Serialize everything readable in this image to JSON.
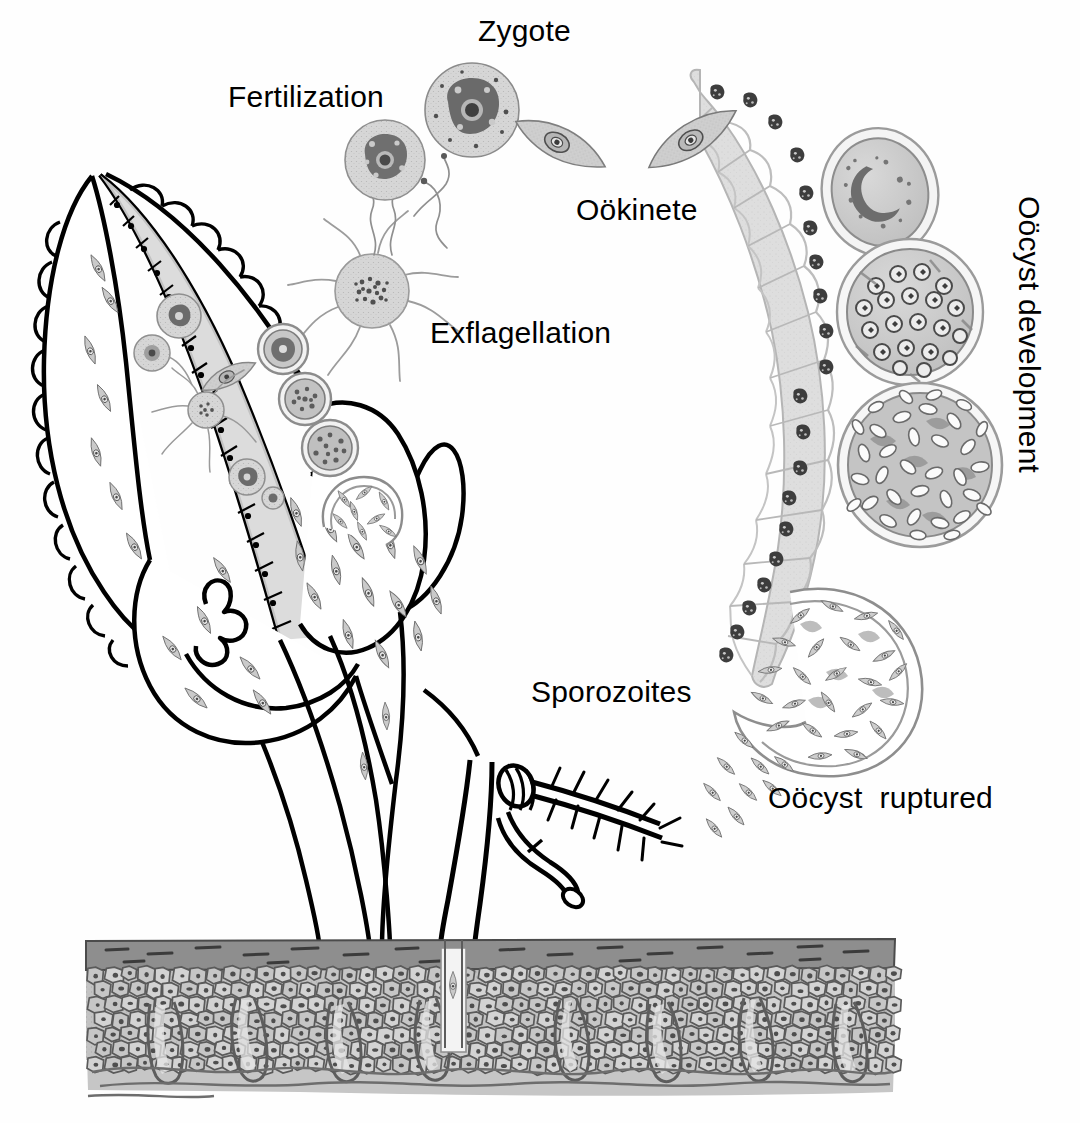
{
  "figure": {
    "type": "biological-diagram",
    "background_color": "#ffffff",
    "ink_color": "#000000",
    "tissue_fill": "#d8d8d8",
    "cell_fill": "#c9c9c9",
    "nucleus_color": "#4a4a4a",
    "skin_fill": "#b9b9b9",
    "skin_corneum": "#8f8f8f"
  },
  "labels": {
    "zygote": "Zygote",
    "fertilization": "Fertilization",
    "ookinete": "Oökinete",
    "exflagellation": "Exflagellation",
    "oocyst_development": "Oöcyst development",
    "oocyst_ruptured": "Oöcyst  ruptured",
    "sporozoites": "Sporozoites"
  },
  "label_positions": {
    "zygote": {
      "x": 478,
      "y": 16,
      "rotate": 0
    },
    "fertilization": {
      "x": 228,
      "y": 82,
      "rotate": 0
    },
    "ookinete": {
      "x": 576,
      "y": 195,
      "rotate": 0
    },
    "exflagellation": {
      "x": 430,
      "y": 318,
      "rotate": 0
    },
    "oocyst_development": {
      "x": 1044,
      "y": 196,
      "rotate": 90
    },
    "sporozoites": {
      "x": 531,
      "y": 677,
      "rotate": 0
    },
    "oocyst_ruptured": {
      "x": 768,
      "y": 783,
      "rotate": 0
    }
  },
  "stages": [
    {
      "name": "exflagellation",
      "description": "Microgametocyte exflagellating, producing whip-like microgametes (flagella)",
      "count_flagella": 7
    },
    {
      "name": "fertilization",
      "description": "Microgamete fertilizing the macrogamete",
      "cells": 1
    },
    {
      "name": "zygote",
      "description": "Fertilized zygote with prominent nucleus",
      "cells": 1
    },
    {
      "name": "ookinete",
      "description": "Motile banana-shaped ookinete penetrating the gut wall",
      "cells": 2
    },
    {
      "name": "oocyst-young",
      "description": "Young oocyst on the outer gut wall with crescent nucleus",
      "cells": 1
    },
    {
      "name": "oocyst-sporoblast",
      "description": "Oocyst with sporoblast masses / developing nuclei",
      "cells": 1
    },
    {
      "name": "oocyst-mature",
      "description": "Mature oocyst packed with sporozoites",
      "sporozoite_count": 34
    },
    {
      "name": "oocyst-ruptured",
      "description": "Ruptured oocyst releasing sporozoites into the haemocoel",
      "sporozoite_count": 38
    },
    {
      "name": "salivary-gland",
      "description": "Salivary gland lobes invaded by sporozoites"
    },
    {
      "name": "proboscis",
      "description": "Mosquito proboscis piercing host skin, injecting sporozoites"
    },
    {
      "name": "skin",
      "description": "Host skin cross-section: stratum corneum, epidermis, dermal papillae"
    }
  ],
  "gut": {
    "name": "mosquito-midgut-epithelium",
    "cell_count": 22,
    "description": "Columnar epithelial cells of the mosquito midgut each bearing a dark nucleus"
  }
}
